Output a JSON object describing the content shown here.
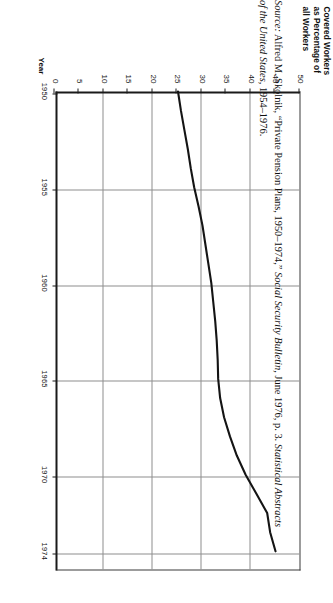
{
  "figure": {
    "y_axis_title_lines": [
      "Covered Workers",
      "as Percentage of",
      "all Workers"
    ],
    "x_axis_title": "Year"
  },
  "source": {
    "label": "Source:",
    "line1_a": " Alfred M. Skolnik, “Private Pension Plans, 1950–1974,” ",
    "line1_b": "Social Security Bulletin,",
    "line1_c": " June 1976, p. 3. ",
    "line1_d": "Statistical Abstracts",
    "line2_a": "of the United States,",
    "line2_b": " 1954–1976."
  },
  "chart_data": {
    "type": "line",
    "title": "",
    "xlabel": "Year",
    "ylabel": "Covered Workers as Percentage of all Workers",
    "xlim": [
      1950,
      1975
    ],
    "ylim": [
      0,
      50
    ],
    "xticks": [
      1950,
      1955,
      1960,
      1965,
      1970,
      1974
    ],
    "yticks": [
      0,
      5,
      10,
      15,
      20,
      25,
      30,
      35,
      40,
      45,
      50
    ],
    "grid": true,
    "legend": "none",
    "series": [
      {
        "name": "Covered Workers as Percentage of all Workers",
        "x": [
          1950,
          1951,
          1952,
          1953,
          1954,
          1955,
          1956,
          1957,
          1958,
          1959,
          1960,
          1961,
          1962,
          1963,
          1964,
          1965,
          1966,
          1967,
          1968,
          1969,
          1970,
          1971,
          1972,
          1973,
          1974
        ],
        "values": [
          25.0,
          25.6,
          26.3,
          27.0,
          27.6,
          28.3,
          29.2,
          30.0,
          30.6,
          31.2,
          31.8,
          32.2,
          32.6,
          32.9,
          33.1,
          33.2,
          33.6,
          34.4,
          35.6,
          37.0,
          38.8,
          41.0,
          43.2,
          43.8,
          44.9
        ]
      }
    ]
  }
}
